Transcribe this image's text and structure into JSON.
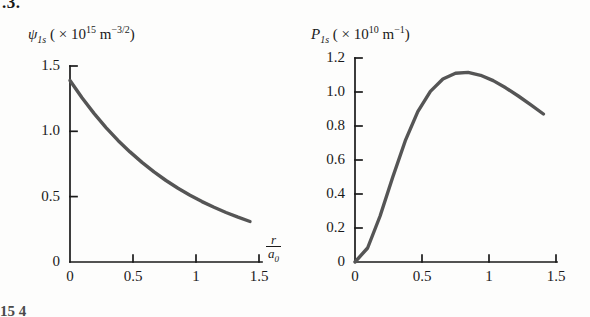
{
  "page": {
    "top_fragment": ".3.",
    "bottom_fragment": "15  4"
  },
  "chart_data": [
    {
      "type": "line",
      "title": "",
      "ylabel": "psi_1s ( x 10^15 m^-3/2 )",
      "ylabel_parts": {
        "symbol": "ψ",
        "subscript": "1s",
        "open": "( × 10",
        "exponent": "15",
        "unit": "m",
        "unit_exponent": "−3/2",
        "close": ")"
      },
      "xlabel": "r/a_0",
      "xlabel_parts": {
        "numerator": "r",
        "denominator": "a",
        "denominator_sub": "0"
      },
      "xlim": [
        0,
        1.6
      ],
      "ylim": [
        0,
        1.62
      ],
      "xticks": [
        "0",
        "0.5",
        "1",
        "1.5"
      ],
      "xtick_values": [
        0,
        0.5,
        1,
        1.5
      ],
      "yticks": [
        "0",
        "0.5",
        "1.0",
        "1.5"
      ],
      "ytick_values": [
        0,
        0.5,
        1.0,
        1.5
      ],
      "grid": false,
      "legend": "none",
      "line_color": "#555555",
      "x": [
        0,
        0.1,
        0.2,
        0.3,
        0.4,
        0.5,
        0.6,
        0.7,
        0.8,
        0.9,
        1.0,
        1.1,
        1.2,
        1.3,
        1.4,
        1.5
      ],
      "values": [
        1.5,
        1.357,
        1.228,
        1.111,
        1.005,
        0.91,
        0.823,
        0.745,
        0.674,
        0.61,
        0.552,
        0.499,
        0.452,
        0.409,
        0.37,
        0.335
      ]
    },
    {
      "type": "line",
      "title": "",
      "ylabel": "P_1s ( x 10^10 m^-1 )",
      "ylabel_parts": {
        "symbol": "P",
        "subscript": "1s",
        "open": "( × 10",
        "exponent": "10",
        "unit": "m",
        "unit_exponent": "−1",
        "close": ")"
      },
      "xlabel": "",
      "xlim": [
        0,
        1.6
      ],
      "ylim": [
        0,
        1.3
      ],
      "xticks": [
        "0",
        "0.5",
        "1",
        "1.5"
      ],
      "xtick_values": [
        0,
        0.5,
        1,
        1.5
      ],
      "yticks": [
        "0",
        "0.2",
        "0.4",
        "0.6",
        "0.8",
        "1.0",
        "1.2"
      ],
      "ytick_values": [
        0,
        0.2,
        0.4,
        0.6,
        0.8,
        1.0,
        1.2
      ],
      "grid": false,
      "legend": "none",
      "line_color": "#555555",
      "x": [
        0,
        0.1,
        0.2,
        0.3,
        0.4,
        0.5,
        0.6,
        0.7,
        0.8,
        0.9,
        1.0,
        1.1,
        1.2,
        1.3,
        1.4,
        1.5
      ],
      "values": [
        0.0,
        0.089,
        0.293,
        0.54,
        0.773,
        0.958,
        1.087,
        1.166,
        1.203,
        1.208,
        1.19,
        1.156,
        1.11,
        1.058,
        1.001,
        0.943
      ]
    }
  ]
}
